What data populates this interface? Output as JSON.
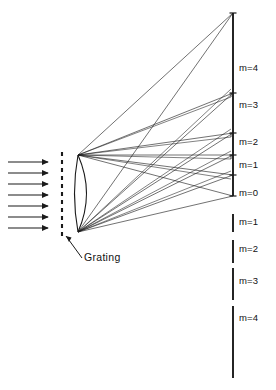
{
  "figure": {
    "background_color": "#ffffff",
    "ink_color": "#1a1a1a",
    "width": 276,
    "height": 390
  },
  "labels": {
    "grating": "Grating",
    "orders_upper": [
      {
        "text": "m=4",
        "x": 239,
        "y": 68
      },
      {
        "text": "m=3",
        "x": 239,
        "y": 105
      },
      {
        "text": "m=2",
        "x": 239,
        "y": 142
      },
      {
        "text": "m=1",
        "x": 239,
        "y": 165
      },
      {
        "text": "m=0",
        "x": 239,
        "y": 193
      }
    ],
    "orders_lower": [
      {
        "text": "m=1",
        "x": 239,
        "y": 222
      },
      {
        "text": "m=2",
        "x": 239,
        "y": 249
      },
      {
        "text": "m=3",
        "x": 239,
        "y": 281
      },
      {
        "text": "m=4",
        "x": 239,
        "y": 318
      }
    ]
  },
  "elements": {
    "incoming_beam": {
      "name": "incident-light-arrows",
      "count": 7,
      "x_start": 8,
      "x_end": 48,
      "y_values": [
        162,
        173,
        184,
        195,
        206,
        217,
        228
      ]
    },
    "grating_line": {
      "name": "grating-dashed-line",
      "x": 62,
      "y_top": 152,
      "y_bottom": 238,
      "dash": "4 4"
    },
    "lens": {
      "name": "lens-body",
      "vertex_top": {
        "x": 78,
        "y": 155
      },
      "vertex_bottom": {
        "x": 78,
        "y": 232
      },
      "bulge": 17
    },
    "screen": {
      "name": "detector-screen",
      "x": 233,
      "upper_top": 13,
      "upper_bottom": 196,
      "lower_segments": [
        {
          "y1": 214,
          "y2": 232
        },
        {
          "y1": 240,
          "y2": 263
        },
        {
          "y1": 268,
          "y2": 300
        },
        {
          "y1": 306,
          "y2": 378
        }
      ]
    },
    "order_ticks_upper": [
      13,
      93,
      133,
      155,
      175,
      196
    ],
    "pointer": {
      "name": "grating-pointer-line",
      "from": {
        "x": 66,
        "y": 236
      },
      "to": {
        "x": 82,
        "y": 258
      }
    }
  },
  "chart_data": {
    "type": "diagram",
    "orders": [
      4,
      3,
      2,
      1,
      0,
      1,
      2,
      3,
      4
    ]
  }
}
